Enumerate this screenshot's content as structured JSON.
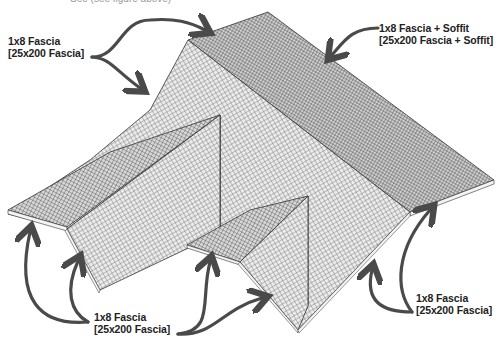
{
  "header": {
    "cut_off_text": "See (see figure above)"
  },
  "labels": {
    "top_left": {
      "line1": "1x8 Fascia",
      "line2": "[25x200 Fascia]"
    },
    "top_right": {
      "line1": "1x8 Fascia + Soffit",
      "line2": "[25x200 Fascia  + Soffit]"
    },
    "bottom_center": {
      "line1": "1x8 Fascia",
      "line2": "[25x200 Fascia]"
    },
    "bottom_right": {
      "line1": "1x8 Fascia",
      "line2": "[25x200 Fascia]"
    }
  },
  "colors": {
    "arrow": "#4a4a4a",
    "roof_fill_light": "#e4e4e4",
    "roof_fill_dark": "#bdbdbd",
    "roof_grid": "#555555",
    "edge": "#333333",
    "fascia": "#f4f4f4",
    "text": "#222222"
  }
}
